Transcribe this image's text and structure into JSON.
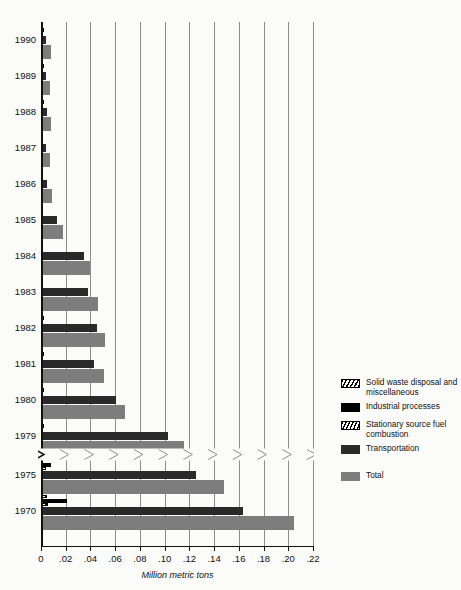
{
  "chart_data": {
    "type": "bar",
    "orientation": "horizontal",
    "title": "",
    "xlabel": "Million metric tons",
    "ylabel": "",
    "xlim": [
      0,
      0.22
    ],
    "xticks": [
      0,
      0.02,
      0.04,
      0.06,
      0.08,
      0.1,
      0.12,
      0.14,
      0.16,
      0.18,
      0.2,
      0.22
    ],
    "xtick_labels": [
      "0",
      ".02",
      ".04",
      ".06",
      ".08",
      ".10",
      ".12",
      ".14",
      ".16",
      ".18",
      ".20",
      ".22"
    ],
    "grid": true,
    "grid_axis": "x",
    "legend_position": "right",
    "axis_break_after_category": "1979",
    "categories": [
      "1990",
      "1989",
      "1988",
      "1987",
      "1986",
      "1985",
      "1984",
      "1983",
      "1982",
      "1981",
      "1980",
      "1979",
      "1975",
      "1970"
    ],
    "series": [
      {
        "name": "Solid waste disposal and miscellaneous",
        "key": "solid",
        "color": "#ffffff",
        "pattern": "cross-hatch",
        "values": [
          0.0014,
          0.0013,
          0.0015,
          0.0013,
          0.0013,
          0.0013,
          0.0013,
          0.0012,
          0.0013,
          0.0013,
          0.0013,
          0.0013,
          0.0013,
          0.0045
        ]
      },
      {
        "name": "Industrial processes",
        "key": "industrial",
        "color": "#000000",
        "pattern": "solid",
        "values": [
          0.0022,
          0.0021,
          0.0021,
          0.002,
          0.002,
          0.002,
          0.002,
          0.002,
          0.0021,
          0.0021,
          0.0021,
          0.0022,
          0.008,
          0.021
        ]
      },
      {
        "name": "Stationary source fuel combustion",
        "key": "stationary",
        "color": "#ffffff",
        "pattern": "diagonal-hatch",
        "values": [
          0.0013,
          0.0013,
          0.0013,
          0.0012,
          0.0013,
          0.0013,
          0.0013,
          0.0013,
          0.0013,
          0.0013,
          0.0013,
          0.0013,
          0.004,
          0.006
        ]
      },
      {
        "name": "Transportation",
        "key": "transport",
        "color": "#2a2a2a",
        "pattern": "solid",
        "values": [
          0.0042,
          0.004,
          0.0045,
          0.0042,
          0.0048,
          0.013,
          0.035,
          0.038,
          0.045,
          0.043,
          0.061,
          0.103,
          0.125,
          0.163
        ]
      },
      {
        "name": "Total",
        "key": "total",
        "color": "#7d7d7d",
        "pattern": "solid",
        "values": [
          0.0078,
          0.0072,
          0.0082,
          0.0076,
          0.009,
          0.018,
          0.04,
          0.046,
          0.052,
          0.051,
          0.068,
          0.116,
          0.148,
          0.205
        ]
      }
    ]
  },
  "legend": {
    "items": [
      {
        "label": "Solid waste disposal and miscellaneous",
        "swatch": "sw-solid",
        "icon": "cross-hatch-swatch"
      },
      {
        "label": "Industrial processes",
        "swatch": "sw-industrial",
        "icon": "black-swatch"
      },
      {
        "label": "Stationary source fuel combustion",
        "swatch": "sw-stationary",
        "icon": "diagonal-hatch-swatch"
      },
      {
        "label": "Transportation",
        "swatch": "sw-transport",
        "icon": "dark-gray-swatch"
      },
      {
        "label": "Total",
        "swatch": "sw-total",
        "icon": "gray-swatch"
      }
    ]
  },
  "colors": {
    "total": "#7d7d7d",
    "transport": "#2a2a2a",
    "industrial": "#000000",
    "grid": "#8d8d8d",
    "axis": "#111111",
    "background": "#fbfbfa"
  }
}
